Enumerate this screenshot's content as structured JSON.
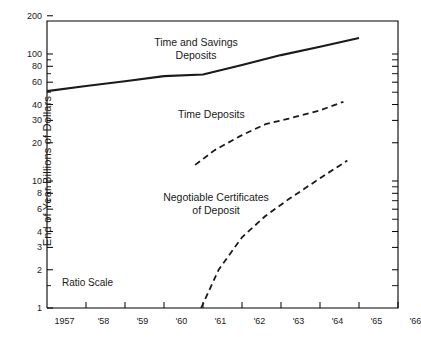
{
  "chart_data": {
    "type": "line",
    "title": "",
    "xlabel": "",
    "ylabel": "End of Year  Billions of Dollars",
    "scale_note": "Ratio Scale",
    "yscale": "log",
    "ylim": [
      1,
      200
    ],
    "xlim": [
      1957,
      1966
    ],
    "grid": false,
    "legend_position": "inline-annotations",
    "ytick_labels": [
      "200",
      "100",
      "80",
      "60",
      "40",
      "30",
      "20",
      "10",
      "8",
      "6",
      "4",
      "3",
      "2",
      "1"
    ],
    "ytick_values": [
      200,
      100,
      80,
      60,
      40,
      30,
      20,
      10,
      8,
      6,
      4,
      3,
      2,
      1
    ],
    "xtick_labels": [
      "1957",
      "'58",
      "'59",
      "'60",
      "'61",
      "'62",
      "'63",
      "'64",
      "'65",
      "'66"
    ],
    "xtick_values": [
      1957,
      1958,
      1959,
      1960,
      1961,
      1962,
      1963,
      1964,
      1965,
      1966
    ],
    "series": [
      {
        "name": "Time and Savings Deposits",
        "style": "solid",
        "label_lines": [
          "Time and Savings",
          "Deposits"
        ],
        "x": [
          1957,
          1958,
          1959,
          1960,
          1961,
          1962,
          1963,
          1964,
          1965
        ],
        "values": [
          51,
          56,
          61,
          67,
          69,
          82,
          98,
          114,
          134
        ]
      },
      {
        "name": "Time Deposits",
        "style": "dashed",
        "label_lines": [
          "Time Deposits"
        ],
        "x": [
          1960.8,
          1961.3,
          1962,
          1962.6,
          1963.2,
          1964,
          1964.6
        ],
        "values": [
          13.4,
          17.5,
          23,
          28,
          31,
          36,
          42
        ]
      },
      {
        "name": "Negotiable Certificates of Deposit",
        "style": "dashed",
        "label_lines": [
          "Negotiable Certificates",
          "of Deposit"
        ],
        "x": [
          1960.95,
          1961.4,
          1962,
          1962.6,
          1963.2,
          1964,
          1964.7
        ],
        "values": [
          1.0,
          2.0,
          3.6,
          5.3,
          7.2,
          10.5,
          14.5
        ]
      }
    ]
  },
  "axis_colors": {
    "frame": "#000000",
    "line": "#1a1a1a"
  }
}
